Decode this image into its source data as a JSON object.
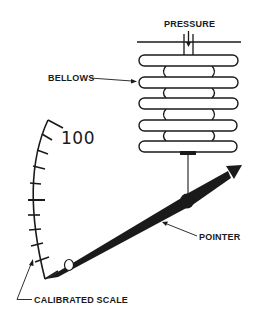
{
  "diagram": {
    "type": "bellows pressure gauge",
    "labels": {
      "pressure": "PRESSURE",
      "bellows": "BELLOWS",
      "pointer": "POINTER",
      "calibrated_scale": "CALIBRATED SCALE",
      "scale_max": "100"
    },
    "colors": {
      "ink": "#1a1a1a",
      "background": "#ffffff"
    },
    "bellows_convolutions": 5,
    "scale_tick_count": 10
  }
}
